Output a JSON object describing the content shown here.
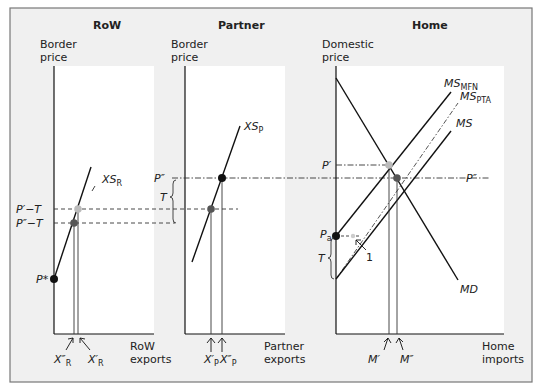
{
  "colors": {
    "outer_bg": "#f0f0f0",
    "frame_border": "#777777",
    "panel_bg": "#ffffff",
    "line": "#111111",
    "dot_black": "#111111",
    "dot_dark_gray": "#555555",
    "dot_light_gray": "#bbbbbb"
  },
  "panels": {
    "row": {
      "title": "RoW",
      "y_axis_label_1": "Border",
      "y_axis_label_2": "price",
      "x_axis_label_1": "RoW",
      "x_axis_label_2": "exports",
      "curve_label": "XS",
      "curve_label_sub": "R",
      "price_labels": {
        "p_prime_minus_t": "P′−T",
        "p_dprime_minus_t": "P″−T",
        "p_star": "P*"
      },
      "x_marks": [
        {
          "label": "X″",
          "sub": "R"
        },
        {
          "label": "X′",
          "sub": "R"
        }
      ]
    },
    "partner": {
      "title": "Partner",
      "y_axis_label_1": "Border",
      "y_axis_label_2": "price",
      "x_axis_label_1": "Partner",
      "x_axis_label_2": "exports",
      "curve_label": "XS",
      "curve_label_sub": "P",
      "price_labels": {
        "p_dprime": "P″",
        "t": "T"
      },
      "x_marks": [
        {
          "label": "X′",
          "sub": "P"
        },
        {
          "label": "X″",
          "sub": "P"
        }
      ]
    },
    "home": {
      "title": "Home",
      "y_axis_label_1": "Domestic",
      "y_axis_label_2": "price",
      "x_axis_label_1": "Home",
      "x_axis_label_2": "imports",
      "curves": [
        {
          "label": "MS",
          "sub": "MFN"
        },
        {
          "label": "MS",
          "sub": "PTA"
        },
        {
          "label": "MS",
          "sub": ""
        },
        {
          "label": "MD",
          "sub": ""
        }
      ],
      "price_labels": {
        "p_prime": "P′",
        "p_dprime_right": "P″",
        "p_a": "P",
        "p_a_sub": "a",
        "t": "T",
        "one": "1"
      },
      "x_marks": [
        {
          "label": "M′"
        },
        {
          "label": "M″"
        }
      ]
    }
  }
}
